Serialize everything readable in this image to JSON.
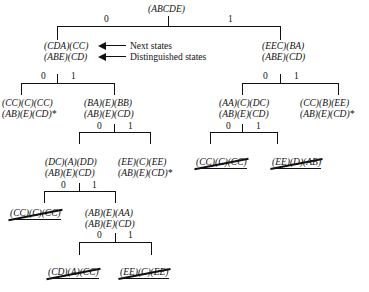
{
  "figure": {
    "title": "",
    "type": "distinguishing-sequence-tree"
  },
  "annotations": {
    "next_states": "Next states",
    "distinguished_states": "Distinguished states",
    "arrow_next_icon": "arrow-left-icon",
    "arrow_distinguished_icon": "arrow-left-icon"
  },
  "edge_labels": {
    "zero": "0",
    "one": "1"
  },
  "tree": {
    "root": {
      "next_states": "(ABCDE)",
      "distinguished_states": ""
    },
    "level1": {
      "left": {
        "next_states": "(CDA)(CC)",
        "distinguished_states": "(ABE)(CD)",
        "edge": "0"
      },
      "right": {
        "next_states": "(EEC)(BA)",
        "distinguished_states": "(ABE)(CD)",
        "edge": "1"
      }
    },
    "level2": {
      "left_left": {
        "next_states": "(CC)(C)(CC)",
        "distinguished_states": "(AB)(E)(CD)*",
        "edge": "0",
        "terminal_star": true,
        "struck": false
      },
      "left_right": {
        "next_states": "(BA)(E)(BB)",
        "distinguished_states": "(AB)(E)(CD)",
        "edge": "1",
        "terminal_star": false,
        "struck": false
      },
      "right_left": {
        "next_states": "(AA)(C)(DC)",
        "distinguished_states": "(AB)(E)(CD)",
        "edge": "0",
        "terminal_star": false,
        "struck": false
      },
      "right_right": {
        "next_states": "(CC)(B)(EE)",
        "distinguished_states": "(AB)(E)(CD)*",
        "edge": "1",
        "terminal_star": true,
        "struck": false
      }
    },
    "level3": {
      "left_branch_left": {
        "next_states": "(DC)(A)(DD)",
        "distinguished_states": "(AB)(E)(CD)",
        "edge": "0",
        "struck": false
      },
      "left_branch_right": {
        "next_states": "(EE)(C)(EE)",
        "distinguished_states": "(AB)(E)(CD)*",
        "edge": "1",
        "terminal_star": true,
        "struck": false
      },
      "right_branch_left": {
        "next_states": "(CC)(C)(CC)",
        "distinguished_states": "",
        "edge": "0",
        "struck": true
      },
      "right_branch_right": {
        "next_states": "(EE)(D)(AB)",
        "distinguished_states": "",
        "edge": "1",
        "struck": true
      }
    },
    "level4": {
      "left": {
        "next_states": "(CC)(C)(CC)",
        "distinguished_states": "",
        "edge": "0",
        "struck": true
      },
      "right": {
        "next_states": "(AB)(E)(AA)",
        "distinguished_states": "(AB)(E)(CD)",
        "edge": "1",
        "struck": false
      }
    },
    "level5": {
      "left": {
        "next_states": "(CD)(A)(CC)",
        "distinguished_states": "",
        "edge": "0",
        "struck": true
      },
      "right": {
        "next_states": "(EE)(C)(EE)",
        "distinguished_states": "",
        "edge": "1",
        "struck": true
      }
    }
  }
}
